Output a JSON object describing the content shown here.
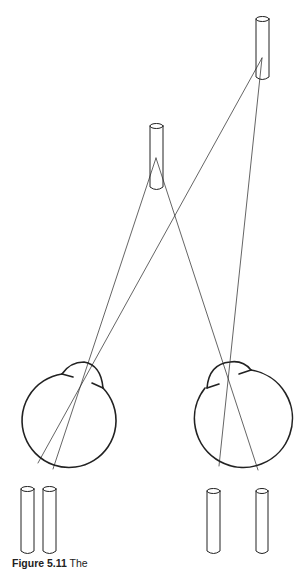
{
  "figure": {
    "caption_label": "Figure 5.11",
    "caption_text": "The"
  },
  "objects": {
    "far_rod": {
      "x": 256,
      "y_top": 16,
      "width": 13,
      "height": 64,
      "focal_point": [
        262,
        58
      ]
    },
    "near_rod": {
      "x": 150,
      "y_top": 123,
      "width": 13,
      "height": 67,
      "focal_point": [
        156,
        158
      ]
    }
  },
  "eyes": {
    "left": {
      "cx": 60,
      "cy": 420,
      "r": 47,
      "nodal_point": [
        88,
        362
      ],
      "retina_near": [
        53,
        469
      ],
      "retina_far": [
        38,
        463
      ]
    },
    "right": {
      "cx": 245,
      "cy": 418,
      "r": 49,
      "nodal_point": [
        228,
        378
      ],
      "retina_near": [
        258,
        470
      ],
      "retina_far": [
        219,
        466
      ]
    }
  },
  "retinal_images": {
    "left": [
      {
        "x": 21,
        "y_top": 487,
        "width": 13
      },
      {
        "x": 43,
        "y_top": 487,
        "width": 13
      }
    ],
    "right": [
      {
        "x": 207,
        "y_top": 489,
        "width": 13
      },
      {
        "x": 256,
        "y_top": 489,
        "width": 12
      }
    ]
  },
  "colors": {
    "stroke": "#222222",
    "background": "#ffffff"
  }
}
